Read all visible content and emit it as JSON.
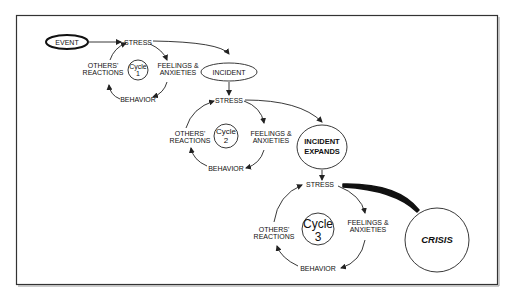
{
  "diagram": {
    "nodes": {
      "event": "EVENT",
      "incident": "INCIDENT",
      "incident_expands_line1": "INCIDENT",
      "incident_expands_line2": "EXPANDS",
      "crisis": "CRISIS"
    },
    "cycles": [
      {
        "title": "Cycle",
        "number": "1",
        "stress": "STRESS",
        "feelings_line1": "FEELINGS &",
        "feelings_line2": "ANXIETIES",
        "behavior": "BEHAVIOR",
        "others_line1": "OTHERS'",
        "others_line2": "REACTIONS"
      },
      {
        "title": "Cycle",
        "number": "2",
        "stress": "STRESS",
        "feelings_line1": "FEELINGS &",
        "feelings_line2": "ANXIETIES",
        "behavior": "BEHAVIOR",
        "others_line1": "OTHERS'",
        "others_line2": "REACTIONS"
      },
      {
        "title": "Cycle",
        "number": "3",
        "stress": "STRESS",
        "feelings_line1": "FEELINGS &",
        "feelings_line2": "ANXIETIES",
        "behavior": "BEHAVIOR",
        "others_line1": "OTHERS'",
        "others_line2": "REACTIONS"
      }
    ],
    "edges": [
      {
        "from": "EVENT",
        "to": "STRESS (Cycle 1)"
      },
      {
        "from": "STRESS (Cycle 1)",
        "to": "INCIDENT"
      },
      {
        "from": "INCIDENT",
        "to": "STRESS (Cycle 2)"
      },
      {
        "from": "STRESS (Cycle 2)",
        "to": "INCIDENT EXPANDS"
      },
      {
        "from": "INCIDENT EXPANDS",
        "to": "STRESS (Cycle 3)"
      },
      {
        "from": "STRESS (Cycle 3)",
        "to": "CRISIS",
        "emphasis": "thick"
      }
    ]
  }
}
